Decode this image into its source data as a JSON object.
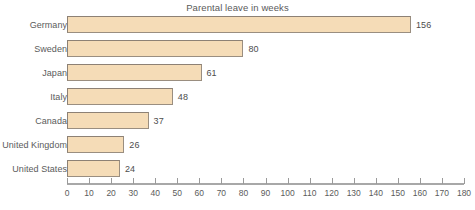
{
  "chart_data": {
    "type": "bar",
    "orientation": "horizontal",
    "title": "Parental leave in weeks",
    "xlabel": "",
    "ylabel": "",
    "categories": [
      "Germany",
      "Sweden",
      "Japan",
      "Italy",
      "Canada",
      "United Kingdom",
      "United States"
    ],
    "values": [
      156,
      80,
      61,
      48,
      37,
      26,
      24
    ],
    "value_labels": [
      "156",
      "80",
      "61",
      "48",
      "37",
      "26",
      "24"
    ],
    "xlim": [
      0,
      180
    ],
    "xticks": [
      0,
      10,
      20,
      30,
      40,
      50,
      60,
      70,
      80,
      90,
      100,
      110,
      120,
      130,
      140,
      150,
      160,
      170,
      180
    ],
    "xtick_labels": [
      "0",
      "10",
      "20",
      "30",
      "40",
      "50",
      "60",
      "70",
      "80",
      "90",
      "100",
      "110",
      "120",
      "130",
      "140",
      "150",
      "160",
      "170",
      "180"
    ],
    "grid": false,
    "legend": null,
    "colors": {
      "bar_fill": "#f5dcb7",
      "bar_border": "#9a8e80",
      "axis_line": "#a8a8a8",
      "text": "#5b5b5b",
      "background": "#ffffff"
    }
  }
}
